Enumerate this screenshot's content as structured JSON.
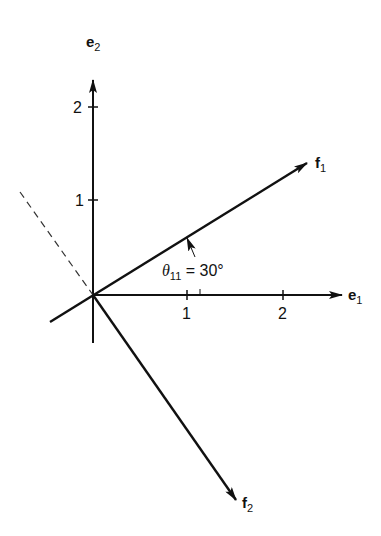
{
  "diagram": {
    "axes": {
      "e1": {
        "label": "e",
        "sub": "1",
        "ticks": [
          "1",
          "2"
        ]
      },
      "e2": {
        "label": "e",
        "sub": "2",
        "ticks": [
          "1",
          "2"
        ]
      }
    },
    "vectors": {
      "f1": {
        "label": "f",
        "sub": "1"
      },
      "f2": {
        "label": "f",
        "sub": "2"
      }
    },
    "angle": {
      "symbol": "θ",
      "sub": "11",
      "text": " = 30°"
    }
  }
}
